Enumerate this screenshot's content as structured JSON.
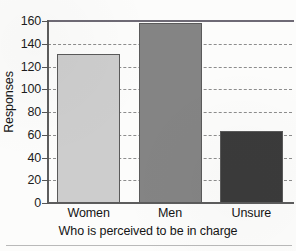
{
  "chart_data": {
    "type": "bar",
    "title": "",
    "categories": [
      "Women",
      "Men",
      "Unsure"
    ],
    "values": [
      131,
      158,
      63
    ],
    "xlabel": "Who is perceived to be in charge",
    "ylabel": "Responses",
    "ylim": [
      0,
      160
    ],
    "ytick_labels": [
      "0",
      "20",
      "40",
      "60",
      "80",
      "100",
      "120",
      "140",
      "160"
    ],
    "ytick_values": [
      0,
      20,
      40,
      60,
      80,
      100,
      120,
      140,
      160
    ],
    "grid": "horizontal-dashed",
    "legend": "none",
    "bar_colors": [
      "#cdcdcd",
      "#848484",
      "#3b3b3b"
    ],
    "bar_edge_color": "#5a5a5a",
    "axis_color": "#5d5d5d",
    "grid_color": "#8d8d8d",
    "top_frame_color": "#6e6a75",
    "background_color": "#fcfcfb"
  }
}
